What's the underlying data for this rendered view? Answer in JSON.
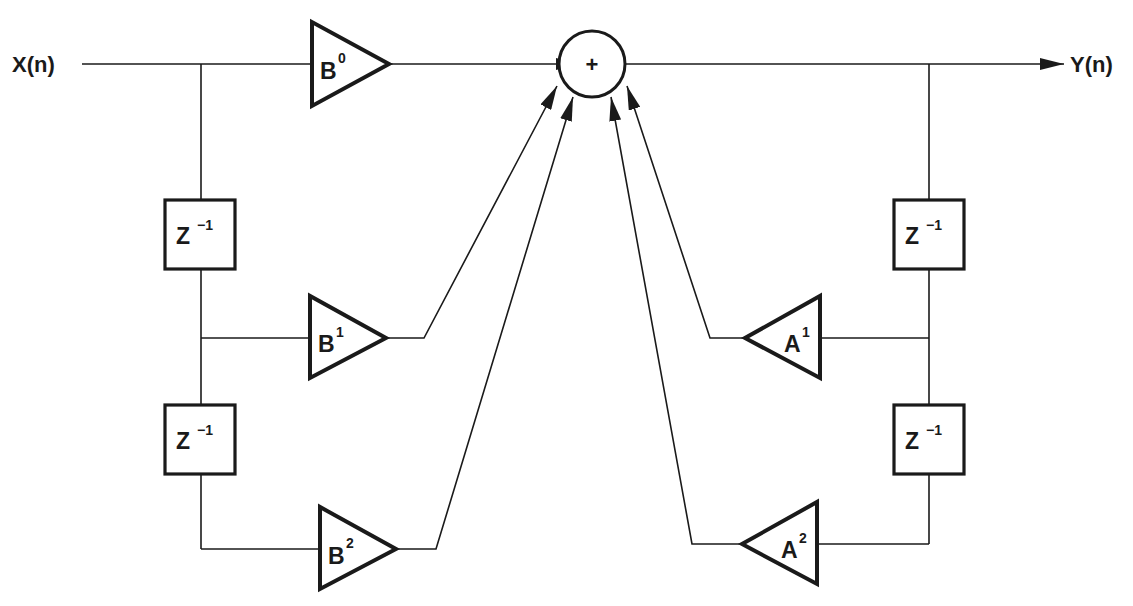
{
  "diagram": {
    "type": "IIR biquad filter (direct form I)",
    "input_label": "X(n)",
    "output_label": "Y(n)",
    "summer_symbol": "+",
    "feedforward_gains": [
      {
        "base": "B",
        "sup": "0"
      },
      {
        "base": "B",
        "sup": "1"
      },
      {
        "base": "B",
        "sup": "2"
      }
    ],
    "feedback_gains": [
      {
        "base": "A",
        "sup": "1"
      },
      {
        "base": "A",
        "sup": "2"
      }
    ],
    "delay_blocks": {
      "input_side": [
        {
          "base": "Z",
          "sup": "−1"
        },
        {
          "base": "Z",
          "sup": "−1"
        }
      ],
      "output_side": [
        {
          "base": "Z",
          "sup": "−1"
        },
        {
          "base": "Z",
          "sup": "−1"
        }
      ]
    },
    "colors": {
      "line": "#1a1a1a",
      "background": "#ffffff"
    }
  }
}
